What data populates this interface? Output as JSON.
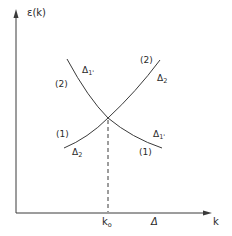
{
  "figure": {
    "y_axis_label": "ε(k)",
    "x_axis_label": "k",
    "x_tick_label": "k",
    "x_tick_sub": "o",
    "x_region_label": "Δ",
    "curves": [
      {
        "name": "Δ1' band",
        "upper_branch_label_symbol": "Δ",
        "upper_branch_label_sub": "1'",
        "upper_branch_index": "(2)",
        "lower_branch_label_symbol": "Δ",
        "lower_branch_label_sub": "1'",
        "lower_branch_index": "(1)"
      },
      {
        "name": "Δ2 band",
        "upper_branch_label_symbol": "Δ",
        "upper_branch_label_sub": "2",
        "upper_branch_index": "(2)",
        "lower_branch_label_symbol": "Δ",
        "lower_branch_label_sub": "2",
        "lower_branch_index": "(1)"
      }
    ],
    "colors": {
      "line": "#3a3a3a",
      "background": "#ffffff"
    }
  }
}
